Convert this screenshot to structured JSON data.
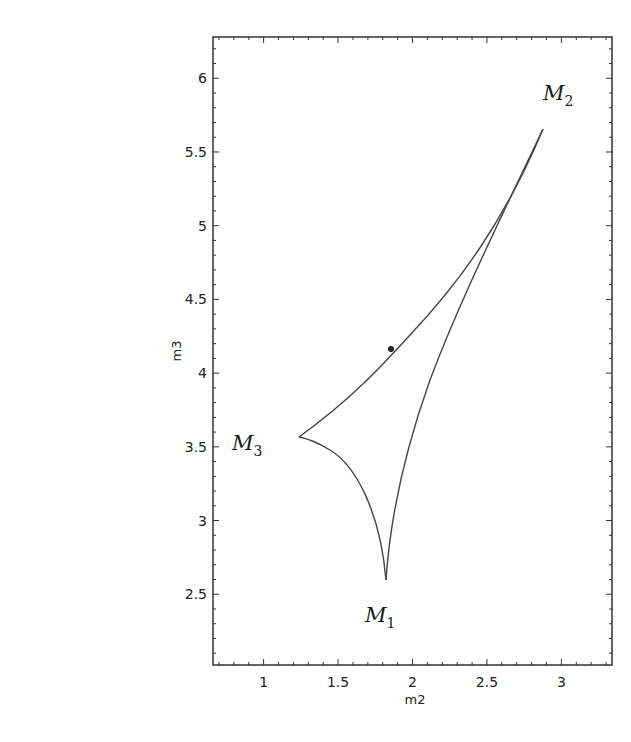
{
  "chart_data": {
    "type": "line",
    "title": "",
    "xlabel": "m2",
    "ylabel": "m3",
    "xlim": [
      0.66,
      3.34
    ],
    "ylim": [
      2.02,
      6.28
    ],
    "xticks": [
      1,
      1.5,
      2,
      2.5,
      3
    ],
    "xtick_labels": [
      "1",
      "1.5",
      "2",
      "2.5",
      "3"
    ],
    "yticks": [
      2.5,
      3,
      3.5,
      4,
      4.5,
      5,
      5.5,
      6
    ],
    "ytick_labels": [
      "2.5",
      "3",
      "3.5",
      "4",
      "4.5",
      "5",
      "5.5",
      "6"
    ],
    "grid": false,
    "legend": null,
    "series": [
      {
        "name": "M3-M2 edge",
        "x": [
          1.23,
          1.4,
          1.6,
          1.84,
          2.1,
          2.4,
          2.65,
          2.88
        ],
        "y": [
          3.56,
          3.72,
          3.9,
          4.15,
          4.45,
          4.85,
          5.22,
          5.62
        ]
      },
      {
        "name": "M2-M1 edge",
        "x": [
          2.88,
          2.6,
          2.35,
          2.1,
          1.95,
          1.82
        ],
        "y": [
          5.62,
          4.92,
          4.25,
          3.55,
          3.1,
          2.6
        ]
      },
      {
        "name": "M1-M3 edge",
        "x": [
          1.82,
          1.78,
          1.7,
          1.58,
          1.43,
          1.23
        ],
        "y": [
          2.6,
          2.9,
          3.15,
          3.35,
          3.49,
          3.56
        ]
      }
    ],
    "annotations": [
      {
        "text": "M",
        "sub": "1",
        "x": 1.82,
        "y": 2.6,
        "note": "cusp"
      },
      {
        "text": "M",
        "sub": "2",
        "x": 2.88,
        "y": 5.62,
        "note": "cusp"
      },
      {
        "text": "M",
        "sub": "3",
        "x": 1.23,
        "y": 3.56,
        "note": "cusp"
      }
    ],
    "marked_point": {
      "x": 1.84,
      "y": 4.15
    }
  },
  "labels": {
    "m1": {
      "main": "M",
      "sub": "1"
    },
    "m2": {
      "main": "M",
      "sub": "2"
    },
    "m3": {
      "main": "M",
      "sub": "3"
    },
    "xlabel": "m2",
    "ylabel": "m3"
  },
  "xticks": [
    "1",
    "1.5",
    "2",
    "2.5",
    "3"
  ],
  "yticks": [
    "2.5",
    "3",
    "3.5",
    "4",
    "4.5",
    "5",
    "5.5",
    "6"
  ]
}
